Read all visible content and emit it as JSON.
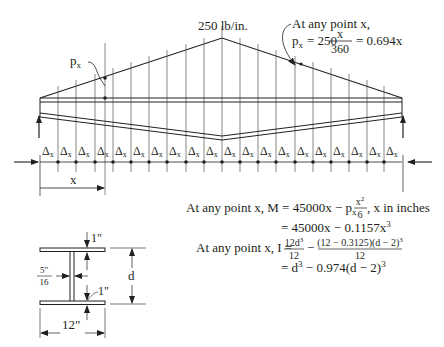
{
  "load_label": "250 lb/in.",
  "px_label": "p",
  "px_sub": "x",
  "annotation": {
    "line1": "At any point x,",
    "px_prefix": "p",
    "px_sub": "x",
    "eq": "= 250",
    "frac_num": "x",
    "frac_den": "360",
    "result": "= 0.694x"
  },
  "segments": {
    "count": 19,
    "label": "Δ",
    "sub": "x"
  },
  "x_dim_label": "x",
  "moment": {
    "line1_prefix": "At any point x, M = 45000x − p",
    "line1_sub": "x",
    "frac_num": "x",
    "frac_num_sup": "2",
    "frac_den": "6",
    "line1_suffix": ", x in inches",
    "line2": "= 45000x − 0.1157x",
    "line2_sup": "3"
  },
  "inertia": {
    "prefix": "At any point x, I =",
    "f1_num": "12d",
    "f1_num_sup": "3",
    "f1_den": "12",
    "minus": "−",
    "f2_num": "(12 − 0.3125)(d − 2)",
    "f2_num_sup": "3",
    "f2_den": "12",
    "line2": "= d",
    "line2_sup": "3",
    "line2_rest": " − 0.974(d − 2)",
    "line2_sup2": "3"
  },
  "section": {
    "flange_top": "1\"",
    "flange_bottom": "1\"",
    "web_num": "5",
    "web_in": "\"",
    "web_den": "16",
    "depth": "d",
    "width": "12\""
  }
}
